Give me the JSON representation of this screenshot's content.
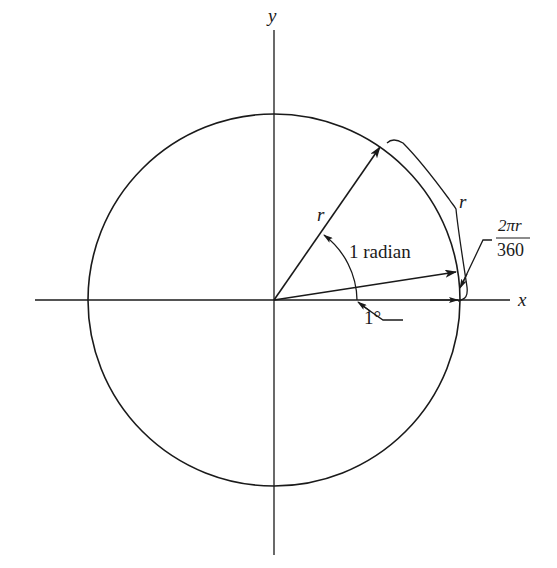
{
  "diagram": {
    "type": "unit-circle-radian-illustration",
    "axes": {
      "x_label": "x",
      "y_label": "y"
    },
    "labels": {
      "radius": "r",
      "arc_length": "r",
      "angle_radian": "1 radian",
      "angle_degree": "1°",
      "small_arc_numerator": "2πr",
      "small_arc_denominator": "360"
    },
    "colors": {
      "stroke": "#1a1a1a",
      "background": "#ffffff"
    }
  }
}
